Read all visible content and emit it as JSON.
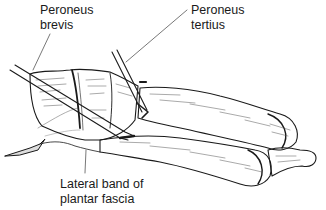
{
  "figure": {
    "style": "black-and-white anatomical line drawing"
  },
  "labels": {
    "peroneus_brevis": {
      "line1": "Peroneus",
      "line2": "brevis"
    },
    "peroneus_tertius": {
      "line1": "Peroneus",
      "line2": "tertius"
    },
    "plantar_fascia": {
      "line1": "Lateral band of",
      "line2": "plantar fascia"
    }
  },
  "colors": {
    "ink": "#1a1a1a",
    "leader_line": "#555555",
    "background": "#ffffff"
  }
}
